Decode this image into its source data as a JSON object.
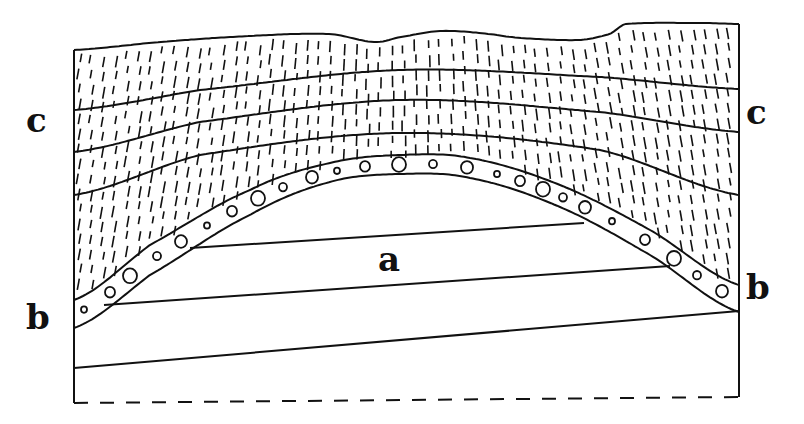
{
  "diagram": {
    "type": "geological-cross-section",
    "labels": {
      "a": "a",
      "b_left": "b",
      "b_right": "b",
      "c_left": "c",
      "c_right": "c"
    },
    "units": [
      {
        "id": "a",
        "description": "tilted lower strata truncated by erosion surface",
        "pattern": "plain",
        "beds": 3
      },
      {
        "id": "b",
        "description": "conglomerate layer draped over anticline",
        "pattern": "pebbles"
      },
      {
        "id": "c",
        "description": "overlying fine-grained beds",
        "pattern": "vertical dashes",
        "beds": 4
      }
    ],
    "colors": {
      "ink": "#111111",
      "background": "#ffffff"
    }
  }
}
